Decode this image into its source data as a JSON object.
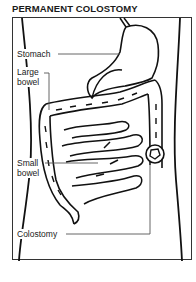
{
  "title": "PERMANENT COLOSTOMY",
  "labels": {
    "stomach": "Stomach",
    "large_bowel_1": "Large",
    "large_bowel_2": "bowel",
    "small_bowel_1": "Small",
    "small_bowel_2": "bowel",
    "colostomy": "Colostomy"
  },
  "colors": {
    "line": "#111111",
    "leader": "#555555",
    "background": "#ffffff"
  }
}
